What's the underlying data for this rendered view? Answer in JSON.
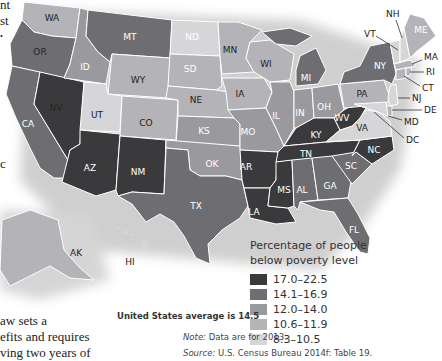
{
  "body_text_fragments": {
    "top": [
      "nt",
      "st",
      "•"
    ],
    "mid": "c",
    "bottom": [
      "aw sets a",
      "efits and requires",
      "ving two years of"
    ]
  },
  "map": {
    "title": "Percentage of people below poverty level",
    "legend": {
      "title_line1": "Percentage of people",
      "title_line2": "below poverty level",
      "bins": [
        {
          "label": "17.0–22.5",
          "color": "#3a3a3c"
        },
        {
          "label": "14.1–16.9",
          "color": "#6e6e72"
        },
        {
          "label": "12.0–14.0",
          "color": "#9a9a9e"
        },
        {
          "label": "10.6–11.9",
          "color": "#b4b4b8"
        },
        {
          "label": "8.3–10.5",
          "color": "#d6d6d8"
        }
      ]
    },
    "average_note": "United States average is 14.5",
    "note_label": "Note:",
    "note_text": " Data are for 2013.",
    "source_label": "Source:",
    "source_text": " U.S. Census Bureau 2014f: Table 19.",
    "states": [
      {
        "code": "WA",
        "bin": 3
      },
      {
        "code": "OR",
        "bin": 1
      },
      {
        "code": "CA",
        "bin": 1
      },
      {
        "code": "NV",
        "bin": 0
      },
      {
        "code": "ID",
        "bin": 2
      },
      {
        "code": "MT",
        "bin": 1
      },
      {
        "code": "WY",
        "bin": 3
      },
      {
        "code": "UT",
        "bin": 4
      },
      {
        "code": "CO",
        "bin": 3
      },
      {
        "code": "AZ",
        "bin": 0
      },
      {
        "code": "NM",
        "bin": 0
      },
      {
        "code": "ND",
        "bin": 4
      },
      {
        "code": "SD",
        "bin": 3
      },
      {
        "code": "NE",
        "bin": 3
      },
      {
        "code": "KS",
        "bin": 2
      },
      {
        "code": "OK",
        "bin": 2
      },
      {
        "code": "TX",
        "bin": 1
      },
      {
        "code": "MN",
        "bin": 3
      },
      {
        "code": "IA",
        "bin": 3
      },
      {
        "code": "MO",
        "bin": 2
      },
      {
        "code": "AR",
        "bin": 0
      },
      {
        "code": "LA",
        "bin": 0
      },
      {
        "code": "WI",
        "bin": 3
      },
      {
        "code": "IL",
        "bin": 2
      },
      {
        "code": "MI",
        "bin": 1
      },
      {
        "code": "IN",
        "bin": 2
      },
      {
        "code": "OH",
        "bin": 2
      },
      {
        "code": "KY",
        "bin": 0
      },
      {
        "code": "TN",
        "bin": 0
      },
      {
        "code": "MS",
        "bin": 0
      },
      {
        "code": "AL",
        "bin": 1
      },
      {
        "code": "GA",
        "bin": 1
      },
      {
        "code": "FL",
        "bin": 1
      },
      {
        "code": "SC",
        "bin": 1
      },
      {
        "code": "NC",
        "bin": 0
      },
      {
        "code": "VA",
        "bin": 4
      },
      {
        "code": "WV",
        "bin": 0
      },
      {
        "code": "PA",
        "bin": 3
      },
      {
        "code": "NY",
        "bin": 1
      },
      {
        "code": "VT",
        "bin": 4
      },
      {
        "code": "NH",
        "bin": 4
      },
      {
        "code": "ME",
        "bin": 3
      },
      {
        "code": "MA",
        "bin": 3
      },
      {
        "code": "RI",
        "bin": 3
      },
      {
        "code": "CT",
        "bin": 3
      },
      {
        "code": "NJ",
        "bin": 4
      },
      {
        "code": "DE",
        "bin": 3
      },
      {
        "code": "MD",
        "bin": 4
      },
      {
        "code": "DC",
        "bin": 1
      },
      {
        "code": "AK",
        "bin": 3
      },
      {
        "code": "HI",
        "bin": 4
      }
    ],
    "callouts": [
      "NH",
      "VT",
      "MA",
      "RI",
      "CT",
      "NJ",
      "DE",
      "MD",
      "DC"
    ]
  }
}
